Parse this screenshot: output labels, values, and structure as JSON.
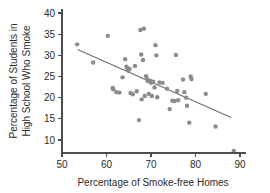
{
  "chart_data": {
    "type": "scatter",
    "title": "",
    "subtitle": "",
    "xlabel": "Percentage of Smoke-free Homes",
    "ylabel": "Percentage of Students in High School Who Smoke",
    "ylabel_lines": [
      "Percentage of Students in",
      "High School Who Smoke"
    ],
    "xlim": [
      50,
      90
    ],
    "ylim": [
      7,
      40
    ],
    "xticks": [
      50,
      60,
      70,
      80,
      90
    ],
    "yticks": [
      10,
      15,
      20,
      25,
      30,
      35,
      40
    ],
    "xtick_labels": [
      "50",
      "60",
      "70",
      "80",
      "90"
    ],
    "ytick_labels": [
      "10",
      "15",
      "20",
      "25",
      "30",
      "35",
      "40"
    ],
    "grid": false,
    "legend": false,
    "legend_position": "none",
    "point_color": "#8c8c8c",
    "line_color": "#6e6e6e",
    "axis_color": "#4d4d4d",
    "trend_line": {
      "type": "linear-fit",
      "x_start": 53.5,
      "y_start": 31.4,
      "x_end": 88.0,
      "y_end": 15.3,
      "slope": -0.467,
      "intercept": 56.4
    },
    "points": [
      {
        "x": 53.4,
        "y": 32.6
      },
      {
        "x": 57.0,
        "y": 28.3
      },
      {
        "x": 60.3,
        "y": 34.6
      },
      {
        "x": 61.4,
        "y": 22.3
      },
      {
        "x": 61.5,
        "y": 22.0
      },
      {
        "x": 62.2,
        "y": 21.3
      },
      {
        "x": 62.9,
        "y": 21.2
      },
      {
        "x": 63.6,
        "y": 24.8
      },
      {
        "x": 64.2,
        "y": 29.1
      },
      {
        "x": 64.5,
        "y": 27.3
      },
      {
        "x": 64.7,
        "y": 26.9
      },
      {
        "x": 64.9,
        "y": 26.4
      },
      {
        "x": 65.2,
        "y": 26.8
      },
      {
        "x": 65.4,
        "y": 21.1
      },
      {
        "x": 65.9,
        "y": 20.8
      },
      {
        "x": 66.4,
        "y": 27.5
      },
      {
        "x": 66.8,
        "y": 21.5
      },
      {
        "x": 67.3,
        "y": 14.7
      },
      {
        "x": 67.6,
        "y": 36.0
      },
      {
        "x": 67.8,
        "y": 30.2
      },
      {
        "x": 67.9,
        "y": 19.6
      },
      {
        "x": 68.2,
        "y": 28.9
      },
      {
        "x": 68.4,
        "y": 36.3
      },
      {
        "x": 68.6,
        "y": 20.4
      },
      {
        "x": 68.9,
        "y": 25.1
      },
      {
        "x": 69.1,
        "y": 24.4
      },
      {
        "x": 69.3,
        "y": 23.9
      },
      {
        "x": 69.5,
        "y": 20.9
      },
      {
        "x": 69.8,
        "y": 24.0
      },
      {
        "x": 70.0,
        "y": 23.5
      },
      {
        "x": 70.2,
        "y": 20.4
      },
      {
        "x": 70.5,
        "y": 23.8
      },
      {
        "x": 70.8,
        "y": 22.4
      },
      {
        "x": 71.0,
        "y": 32.4
      },
      {
        "x": 71.2,
        "y": 30.0
      },
      {
        "x": 71.4,
        "y": 20.1
      },
      {
        "x": 71.9,
        "y": 23.6
      },
      {
        "x": 72.6,
        "y": 23.5
      },
      {
        "x": 73.6,
        "y": 22.1
      },
      {
        "x": 74.2,
        "y": 17.3
      },
      {
        "x": 74.8,
        "y": 19.3
      },
      {
        "x": 75.3,
        "y": 19.2
      },
      {
        "x": 75.6,
        "y": 30.1
      },
      {
        "x": 75.9,
        "y": 21.6
      },
      {
        "x": 76.1,
        "y": 19.4
      },
      {
        "x": 77.2,
        "y": 24.3
      },
      {
        "x": 77.5,
        "y": 21.3
      },
      {
        "x": 77.9,
        "y": 20.0
      },
      {
        "x": 78.1,
        "y": 18.1
      },
      {
        "x": 78.6,
        "y": 14.1
      },
      {
        "x": 78.9,
        "y": 25.0
      },
      {
        "x": 79.1,
        "y": 24.4
      },
      {
        "x": 82.3,
        "y": 20.9
      },
      {
        "x": 84.5,
        "y": 13.2
      },
      {
        "x": 88.6,
        "y": 7.4
      }
    ]
  }
}
